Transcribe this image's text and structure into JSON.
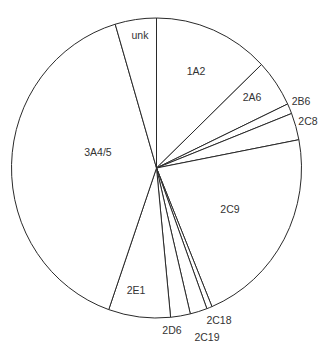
{
  "chart_data": {
    "type": "pie",
    "title": "",
    "start_angle_deg": 0,
    "direction": "clockwise",
    "categories": [
      "1A2",
      "2A6",
      "2B6",
      "2C8",
      "2C9",
      "2C18",
      "2C19",
      "2D6",
      "2E1",
      "3A4/5",
      "unk"
    ],
    "values": [
      12.9,
      5.1,
      1.1,
      2.9,
      21.8,
      0.6,
      1.9,
      2.2,
      6.9,
      40.1,
      4.6
    ],
    "unit": "percent (estimated from slice angles)",
    "labels": [
      {
        "text": "1A2",
        "x": 196,
        "y": 72
      },
      {
        "text": "2A6",
        "x": 252,
        "y": 98
      },
      {
        "text": "2B6",
        "x": 301,
        "y": 102
      },
      {
        "text": "2C8",
        "x": 308,
        "y": 122
      },
      {
        "text": "2C9",
        "x": 230,
        "y": 210
      },
      {
        "text": "2C18",
        "x": 219,
        "y": 321
      },
      {
        "text": "2C19",
        "x": 207,
        "y": 338
      },
      {
        "text": "2D6",
        "x": 172,
        "y": 331
      },
      {
        "text": "2E1",
        "x": 136,
        "y": 291
      },
      {
        "text": "3A4/5",
        "x": 98,
        "y": 153
      },
      {
        "text": "unk",
        "x": 140,
        "y": 36
      }
    ],
    "colors": {
      "fill": "#ffffff",
      "stroke": "#2a2a2a",
      "label": "#333333"
    },
    "geometry": {
      "cx": 156.5,
      "cy": 168,
      "rx": 145,
      "ry": 150
    },
    "legend": "none",
    "grid": false
  }
}
